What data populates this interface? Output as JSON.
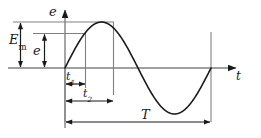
{
  "figure": {
    "background_color": "#ffffff",
    "curve_color": "#1a1a1a",
    "axis_color": "#808080",
    "guide_color": "#808080",
    "dimension_color": "#1a1a1a"
  },
  "axes": {
    "vertical_label": "e",
    "horizontal_label": "t",
    "vertical_name": "electromotive force",
    "horizontal_name": "time"
  },
  "labels": {
    "amplitude": "E",
    "amplitude_sub": "m",
    "instantaneous": "e",
    "time1": "t",
    "time1_sub": "1",
    "time2": "t",
    "time2_sub": "2",
    "period": "T"
  },
  "chart_data": {
    "type": "line",
    "xlabel": "t",
    "ylabel": "e",
    "grid": false,
    "legend": null,
    "equation": "e = E_m * sin(2*pi*t/T)",
    "x": [
      0,
      0.0625,
      0.125,
      0.1875,
      0.25,
      0.3125,
      0.375,
      0.4375,
      0.5,
      0.5625,
      0.625,
      0.6875,
      0.75,
      0.8125,
      0.875,
      0.9375,
      1
    ],
    "values": [
      0,
      0.383,
      0.707,
      0.924,
      1.0,
      0.924,
      0.707,
      0.383,
      0,
      -0.383,
      -0.707,
      -0.924,
      -1.0,
      -0.924,
      -0.707,
      -0.383,
      0
    ],
    "xlim": [
      0,
      1.12
    ],
    "ylim": [
      -1.12,
      1.12
    ],
    "annotations": [
      {
        "name": "E_m",
        "text": "E_m",
        "kind": "vertical-dimension",
        "value": 1.0,
        "description": "peak amplitude from axis to crest level"
      },
      {
        "name": "e",
        "text": "e",
        "kind": "vertical-dimension",
        "value": 0.707,
        "description": "instantaneous value at time t1"
      },
      {
        "name": "t_1",
        "text": "t_1",
        "kind": "horizontal-dimension",
        "value": 0.125,
        "description": "time at which instantaneous value e occurs"
      },
      {
        "name": "t_2",
        "text": "t_2",
        "kind": "horizontal-dimension",
        "value": 0.25,
        "description": "time at which peak E_m occurs"
      },
      {
        "name": "T",
        "text": "T",
        "kind": "horizontal-dimension",
        "value": 1.0,
        "description": "full period of one cycle"
      }
    ]
  }
}
